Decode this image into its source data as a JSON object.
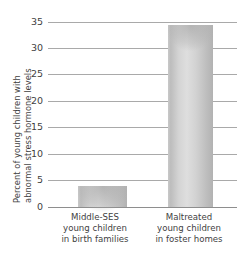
{
  "chart_data": {
    "type": "bar",
    "title": "",
    "xlabel": "",
    "ylabel": "Percent of young children with abnormal stress hormone levels",
    "ylabel_lines": [
      "Percent of young children with",
      "abnormal stress hormone levels"
    ],
    "categories": [
      "Middle-SES young children in birth families",
      "Maltreated young children in foster homes"
    ],
    "category_lines": [
      [
        "Middle-SES",
        "young children",
        "in birth families"
      ],
      [
        "Maltreated",
        "young children",
        "in foster homes"
      ]
    ],
    "values": [
      4,
      34.5
    ],
    "ylim": [
      0,
      35
    ],
    "yticks": [
      0,
      5,
      10,
      15,
      20,
      25,
      30,
      35
    ],
    "ytick_labels": [
      "0",
      "5",
      "10",
      "15",
      "20",
      "25",
      "30",
      "35"
    ],
    "grid": true,
    "legend": null,
    "bar_color": "#d2d2d2",
    "gridline_color": "#a9a9a9",
    "text_color": "#3f3f3f"
  }
}
